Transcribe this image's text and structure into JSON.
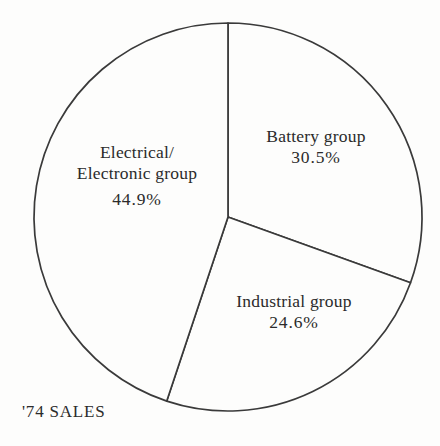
{
  "caption": "'74 SALES",
  "chart_data": {
    "type": "pie",
    "title": "'74 SALES",
    "xlabel": "",
    "ylabel": "",
    "legend_position": "none",
    "grid": false,
    "units": "percent",
    "start_angle_deg": 0,
    "direction": "clockwise",
    "total": 100.0,
    "categories": [
      "Battery group",
      "Industrial group",
      "Electrical/Electronic group"
    ],
    "values": [
      30.5,
      24.6,
      44.9
    ],
    "slices": [
      {
        "name": "Battery group",
        "label_line1": "Battery group",
        "label_line2": "",
        "value": 30.5,
        "value_text": "30.5%",
        "start_angle_deg": 0,
        "end_angle_deg": 109.8,
        "color": "#fdfdfc"
      },
      {
        "name": "Industrial group",
        "label_line1": "Industrial group",
        "label_line2": "",
        "value": 24.6,
        "value_text": "24.6%",
        "start_angle_deg": 109.8,
        "end_angle_deg": 198.4,
        "color": "#fdfdfc"
      },
      {
        "name": "Electrical/Electronic group",
        "label_line1": "Electrical/",
        "label_line2": "Electronic group",
        "value": 44.9,
        "value_text": "44.9%",
        "start_angle_deg": 198.4,
        "end_angle_deg": 360,
        "color": "#fdfdfc"
      }
    ]
  },
  "style": {
    "background": "#fdfdfc",
    "stroke": "#3a3a3a",
    "text": "#2b2b2b"
  }
}
